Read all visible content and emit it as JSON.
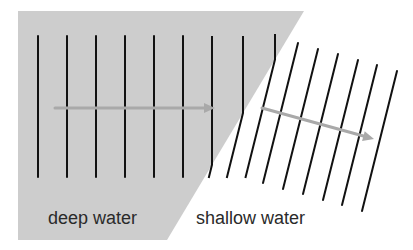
{
  "diagram": {
    "labels": {
      "deep": "deep water",
      "shallow": "shallow water"
    },
    "colors": {
      "deep_fill": "#cdcdcd",
      "shallow_fill": "#ffffff",
      "wavefront": "#111111",
      "arrow": "#a9a9a9",
      "text": "#2a2a2a"
    },
    "wavefronts": {
      "deep_count": 9,
      "shallow_count": 9
    },
    "arrows": [
      {
        "name": "deep-water-direction-arrow",
        "direction": "horizontal"
      },
      {
        "name": "shallow-water-direction-arrow",
        "direction": "bent-downward"
      }
    ]
  }
}
